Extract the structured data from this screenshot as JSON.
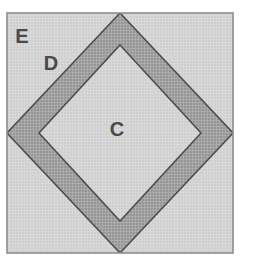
{
  "figure": {
    "kind": "square-in-a-square block",
    "background_color": "#ffffff"
  },
  "canvas": {
    "width": 254,
    "height": 265
  },
  "block": {
    "x": 7,
    "y": 13,
    "width": 226,
    "height": 240,
    "border_color": "#8e8e8e",
    "border_width": 1.5
  },
  "pieces": [
    {
      "id": "C",
      "label": "C",
      "name": "center-square-on-point",
      "shape": "diamond",
      "fill_color": "#cfcfcf",
      "edge_color": "#4f4f4f",
      "label_x": 117,
      "label_y": 131,
      "label_size": 20
    },
    {
      "id": "D",
      "label": "D",
      "name": "middle-band-triangle",
      "shape": "band",
      "fill_color": "#969696",
      "edge_color": "#4f4f4f",
      "label_x": 51,
      "label_y": 65,
      "label_size": 20
    },
    {
      "id": "E",
      "label": "E",
      "name": "corner-triangle",
      "shape": "corner-triangle",
      "fill_color": "#cfcfcf",
      "edge_color": "#4f4f4f",
      "label_x": 22,
      "label_y": 38,
      "label_size": 20
    }
  ],
  "texture": {
    "name": "crosshatch-weave",
    "line_color": "#ffffff",
    "spacing": 3
  },
  "legend": {
    "visible": false
  }
}
